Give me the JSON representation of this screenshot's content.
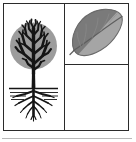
{
  "figure": {
    "name": "tree-and-leaf-diagram",
    "caption": "",
    "background_color": "#ffffff",
    "frame": {
      "border_color": "#2b2b2b",
      "border_width_px": 1.4,
      "x": 3,
      "y": 3,
      "width": 126,
      "height": 128
    },
    "dividers": {
      "vertical_x": 60,
      "horizontal_y": 60,
      "color": "#2b2b2b"
    },
    "bottom_rule": {
      "color": "#b8b8b8",
      "y": 138,
      "width": 130
    }
  },
  "cells": [
    {
      "id": "cell-tree",
      "label": "tree-with-roots",
      "contents": "deciduous tree with dense branching canopy, trunk, ground line and spreading root system",
      "empty": false
    },
    {
      "id": "cell-leaf",
      "label": "leaf",
      "contents": "single ovate leaf tilted diagonally, two-tone shading split along the midrib",
      "empty": false
    },
    {
      "id": "cell-empty",
      "label": "blank-panel",
      "contents": "",
      "empty": true
    }
  ],
  "tree": {
    "canopy": {
      "fill": "#9c9c9c",
      "center_x": 30,
      "center_y": 42,
      "radius": 24
    },
    "branch_color": "#151515",
    "trunk_color": "#151515",
    "ground_line": {
      "color": "#151515",
      "y": 84
    },
    "root_color": "#151515"
  },
  "leaf": {
    "upper_fill": "#7a7a7a",
    "lower_fill": "#a5a5a5",
    "outline": "#6a6a6a",
    "midrib_color": "#5e5e5e",
    "tilt_degrees": -32
  }
}
